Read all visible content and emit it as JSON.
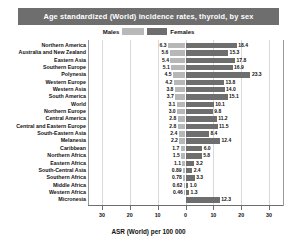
{
  "title": "Age standardized (World) incidence rates, thyroid, by sex",
  "legend": {
    "male_label": "Males",
    "female_label": "Females",
    "male_color": "#b7b7b7",
    "female_color": "#6e6e6e"
  },
  "axis": {
    "title": "ASR (World) per 100 000",
    "ticks": [
      "30",
      "20",
      "10",
      "0",
      "10",
      "20",
      "30"
    ],
    "tick_values": [
      -30,
      -20,
      -10,
      0,
      10,
      20,
      30
    ],
    "min": -35,
    "max": 35
  },
  "colors": {
    "banner": "#6e6e6e",
    "banner_text": "#ffffff",
    "gridline": "#d9d9d9",
    "axis": "#6e6e6e",
    "text": "#111111"
  },
  "chart_data": {
    "type": "bar",
    "orientation": "horizontal-diverging",
    "title": "Age standardized (World) incidence rates, thyroid, by sex",
    "xlabel": "ASR (World) per 100 000",
    "ylabel": "",
    "xlim": [
      -35,
      35
    ],
    "grid": true,
    "legend_position": "top-center",
    "categories": [
      "Northern America",
      "Australia and New Zealand",
      "Eastern Asia",
      "Southern Europe",
      "Polynesia",
      "Western Europe",
      "Western Asia",
      "South America",
      "World",
      "Northern Europe",
      "Central America",
      "Central and Eastern Europe",
      "South-Eastern Asia",
      "Melanesia",
      "Caribbean",
      "Northern Africa",
      "Eastern Africa",
      "South-Central Asia",
      "Southern Africa",
      "Middle Africa",
      "Western Africa",
      "Micronesia"
    ],
    "series": [
      {
        "name": "Males",
        "color": "#b7b7b7",
        "values": [
          6.3,
          5.6,
          5.4,
          5.1,
          4.5,
          4.2,
          3.8,
          3.7,
          3.1,
          3.0,
          2.8,
          2.8,
          2.4,
          2.2,
          1.7,
          1.5,
          1.1,
          0.89,
          0.78,
          0.62,
          0.46,
          null
        ],
        "labels": [
          "6.3",
          "5.6",
          "5.4",
          "5.1",
          "4.5",
          "4.2",
          "3.8",
          "3.7",
          "3.1",
          "3.0",
          "2.8",
          "2.8",
          "2.4",
          "2.2",
          "1.7",
          "1.5",
          "1.1",
          "0.89",
          "0.78",
          "0.62",
          "0.46",
          ""
        ]
      },
      {
        "name": "Females",
        "color": "#6e6e6e",
        "values": [
          18.4,
          15.3,
          17.8,
          16.9,
          23.3,
          13.8,
          14.0,
          15.1,
          10.1,
          9.8,
          11.2,
          11.5,
          8.4,
          12.4,
          6.0,
          5.8,
          3.2,
          2.4,
          3.3,
          1.0,
          1.3,
          12.3
        ],
        "labels": [
          "18.4",
          "15.3",
          "17.8",
          "16.9",
          "23.3",
          "13.8",
          "14.0",
          "15.1",
          "10.1",
          "9.8",
          "11.2",
          "11.5",
          "8.4",
          "12.4",
          "6.0",
          "5.8",
          "3.2",
          "2.4",
          "3.3",
          "1.0",
          "1.3",
          "12.3"
        ]
      }
    ]
  }
}
